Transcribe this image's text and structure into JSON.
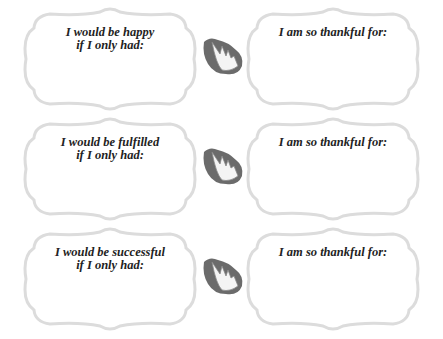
{
  "worksheet": {
    "rows": [
      {
        "prompt_line1": "I would be happy",
        "prompt_line2": "if I only had:",
        "thankful": "I am so thankful for:"
      },
      {
        "prompt_line1": "I would be fulfilled",
        "prompt_line2": "if I only had:",
        "thankful": "I am so thankful for:"
      },
      {
        "prompt_line1": "I would be successful",
        "prompt_line2": "if I only had:",
        "thankful": "I am so thankful for:"
      }
    ],
    "icon": "pointing-hand-icon",
    "colors": {
      "frame": "#dcdcdc",
      "text": "#222222",
      "hand_shadow": "#3a3a3a"
    }
  }
}
